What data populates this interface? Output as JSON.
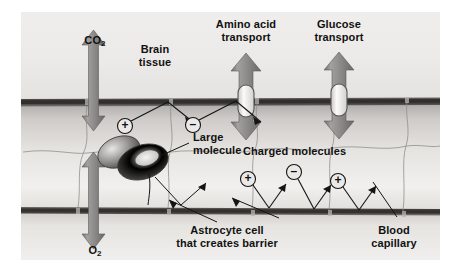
{
  "figure": {
    "frame": {
      "x": 21,
      "y": 12,
      "width": 419,
      "height": 248
    }
  },
  "regions": {
    "brain_tissue_top": "brain tissue above capillary",
    "capillary_lumen": "blood capillary lumen",
    "brain_tissue_bottom": "brain tissue below capillary"
  },
  "labels": {
    "co2": "CO",
    "co2_sub": "2",
    "brain_tissue_line1": "Brain",
    "brain_tissue_line2": "tissue",
    "amino_acid_line1": "Amino acid",
    "amino_acid_line2": "transport",
    "glucose_line1": "Glucose",
    "glucose_line2": "transport",
    "large_molecule_line1": "Large",
    "large_molecule_line2": "molecule",
    "charged_molecules": "Charged molecules",
    "astrocyte_line1": "Astrocyte cell",
    "astrocyte_line2": "that creates barrier",
    "blood_capillary_line1": "Blood",
    "blood_capillary_line2": "capillary",
    "o2": "O",
    "o2_sub": "2"
  },
  "symbols": {
    "positive": "+",
    "negative": "–"
  },
  "colors": {
    "page_background": "#ffffff",
    "tissue_light": "#f0efed",
    "tissue_mid": "#d8d7d4",
    "lumen_light": "#eceae7",
    "lumen_shade": "#b9b7b4",
    "membrane_dark": "#4c4a48",
    "membrane_core": "#3a3836",
    "arrow_gray": "#8e8c8a",
    "arrow_gray_dark": "#6e6c6a",
    "molecule_dark": "#565452",
    "molecule_light": "#eceae8",
    "transporter_fill": "#f4f3f1",
    "line_black": "#141414",
    "cell_border": "#9a9896",
    "text": "#111111"
  },
  "elements": {
    "co2_arrow": "double-headed vertical arrow crossing upper membrane",
    "o2_arrow": "double-headed vertical arrow crossing lower membrane",
    "amino_acid_arrow": "double-headed vertical arrow with transporter capsule in upper membrane",
    "glucose_arrow": "double-headed vertical arrow with transporter capsule in upper membrane",
    "large_molecule": "large shaded blob blocked by barrier",
    "charged_upper": [
      "+",
      "–"
    ],
    "charged_lower": [
      "+",
      "–",
      "+"
    ]
  }
}
